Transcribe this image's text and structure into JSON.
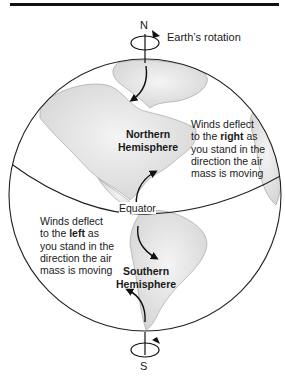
{
  "diagram": {
    "labels": {
      "north_pole": "N",
      "south_pole": "S",
      "rotation": "Earth’s rotation",
      "equator": "Equator",
      "northern_hemisphere_line1": "Northern",
      "northern_hemisphere_line2": "Hemisphere",
      "southern_hemisphere_line1": "Southern",
      "southern_hemisphere_line2": "Hemisphere"
    },
    "northern_note": {
      "line1": "Winds deflect",
      "line2_pre": "to the ",
      "line2_bold": "right",
      "line2_post": " as",
      "line3": "you stand in the",
      "line4": "direction the air",
      "line5": "mass is moving"
    },
    "southern_note": {
      "line1": "Winds deflect",
      "line2_pre": "to the ",
      "line2_bold": "left",
      "line2_post": " as",
      "line3": "you stand in the",
      "line4": "direction the air",
      "line5": "mass is moving"
    },
    "colors": {
      "outline": "#222222",
      "land_fill": "#e4e4e4",
      "ocean_fill": "#ffffff",
      "coast": "#9a9a9a"
    }
  }
}
